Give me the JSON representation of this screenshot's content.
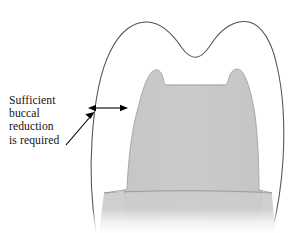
{
  "figure": {
    "kind": "dental-preparation-cross-section-diagram",
    "background_color": "#ffffff"
  },
  "annotation": {
    "name": "buccal-reduction-callout",
    "lines": [
      "Sufficient",
      "buccal",
      "reduction",
      "is required"
    ],
    "full_text": "Sufficient buccal reduction is required",
    "text_color": "#141414"
  },
  "shapes": {
    "original_tooth_outline": {
      "name": "original-tooth-contour",
      "stroke_color": "#4d4d52",
      "fill_color": "#ffffff",
      "description": "two-cusp molar crown outline with central fissure"
    },
    "prepared_tooth": {
      "name": "prepared-tooth-core",
      "fill_color": "#c9c9c9",
      "stroke_color": "#9a9a9a",
      "description": "shaded reduced tooth core with flattened occlusal table"
    }
  },
  "measure_arrow": {
    "name": "buccal-reduction-measure-arrow",
    "style": "double-headed-horizontal",
    "color": "#000000",
    "x_start": 88,
    "x_end": 128,
    "y": 108
  },
  "pointer_arrow": {
    "name": "callout-pointer-arrow",
    "style": "single-headed-diagonal",
    "color": "#000000",
    "from_x": 68,
    "from_y": 143,
    "to_x": 94,
    "to_y": 113
  }
}
